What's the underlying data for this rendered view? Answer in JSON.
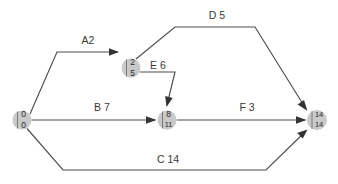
{
  "diagram": {
    "type": "activity-on-arrow-network",
    "nodes": [
      {
        "id": "n1",
        "early": "0",
        "late": "0",
        "cx": 22,
        "cy": 120,
        "r": 9.5
      },
      {
        "id": "n2",
        "early": "2",
        "late": "5",
        "cx": 131,
        "cy": 68,
        "r": 9.5
      },
      {
        "id": "n3",
        "early": "8",
        "late": "11",
        "cx": 167,
        "cy": 120,
        "r": 9.5
      },
      {
        "id": "n4",
        "early": "14",
        "late": "14",
        "cx": 317,
        "cy": 120,
        "r": 10
      }
    ],
    "edges": [
      {
        "id": "A",
        "label": "A2",
        "activity": "A",
        "duration": 2,
        "from": "n1",
        "to": "n2",
        "label_x": 88,
        "label_y": 41
      },
      {
        "id": "B",
        "label": "B 7",
        "activity": "B",
        "duration": 7,
        "from": "n1",
        "to": "n3",
        "label_x": 102,
        "label_y": 108
      },
      {
        "id": "C",
        "label": "C 14",
        "activity": "C",
        "duration": 14,
        "from": "n1",
        "to": "n4",
        "label_x": 168,
        "label_y": 160
      },
      {
        "id": "D",
        "label": "D 5",
        "activity": "D",
        "duration": 5,
        "from": "n2",
        "to": "n4",
        "label_x": 217,
        "label_y": 16
      },
      {
        "id": "E",
        "label": "E 6",
        "activity": "E",
        "duration": 6,
        "from": "n2",
        "to": "n3",
        "label_x": 158,
        "label_y": 66
      },
      {
        "id": "F",
        "label": "F 3",
        "activity": "F",
        "duration": 3,
        "from": "n3",
        "to": "n4",
        "label_x": 247,
        "label_y": 108
      }
    ],
    "colors": {
      "node_fill": "#c9c9c9",
      "edge_stroke": "#4d4d4d",
      "arrow_fill": "#333333",
      "text": "#2b2b2b",
      "background": "#ffffff"
    }
  }
}
